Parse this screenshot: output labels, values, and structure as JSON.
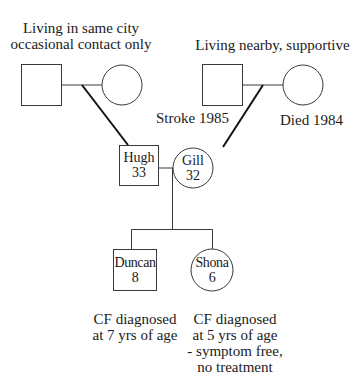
{
  "diagram": {
    "type": "genogram",
    "paternal_grandparents": {
      "note": "Living in same city\noccasional contact only",
      "note_line1": "Living in same city",
      "note_line2": "occasional contact only",
      "grandfather": {
        "shape": "square",
        "label": ""
      },
      "grandmother": {
        "shape": "circle",
        "label": ""
      }
    },
    "maternal_grandparents": {
      "note": "Living nearby, supportive",
      "grandfather": {
        "shape": "square",
        "annotation": "Stroke 1985"
      },
      "grandmother": {
        "shape": "circle",
        "annotation": "Died 1984"
      }
    },
    "parents": {
      "father": {
        "shape": "square",
        "name": "Hugh",
        "age": "33"
      },
      "mother": {
        "shape": "circle",
        "name": "Gill",
        "age": "32"
      }
    },
    "children": [
      {
        "shape": "square",
        "name": "Duncan",
        "age": "8",
        "notes": [
          "CF diagnosed",
          "at 7 yrs of age"
        ]
      },
      {
        "shape": "circle",
        "name": "Shona",
        "age": "6",
        "notes": [
          "CF diagnosed",
          "at 5 yrs of age",
          "- symptom free,",
          "no treatment"
        ]
      }
    ],
    "colors": {
      "line": "#3a3a3a",
      "descent_line": "#111111",
      "background": "#ffffff"
    }
  }
}
